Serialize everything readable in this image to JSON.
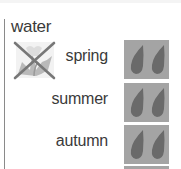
{
  "section": {
    "title": "water",
    "icon": "no-plant-icon"
  },
  "rows": [
    {
      "label": "spring",
      "icon": "water-drops-icon",
      "drops": 2
    },
    {
      "label": "summer",
      "icon": "water-drops-icon",
      "drops": 2
    },
    {
      "label": "autumn",
      "icon": "water-drops-icon",
      "drops": 2
    }
  ],
  "colors": {
    "box_bg": "#a4a4a4",
    "drop": "#6a6a6a",
    "text": "#3a3a3a",
    "cross": "#777777"
  }
}
